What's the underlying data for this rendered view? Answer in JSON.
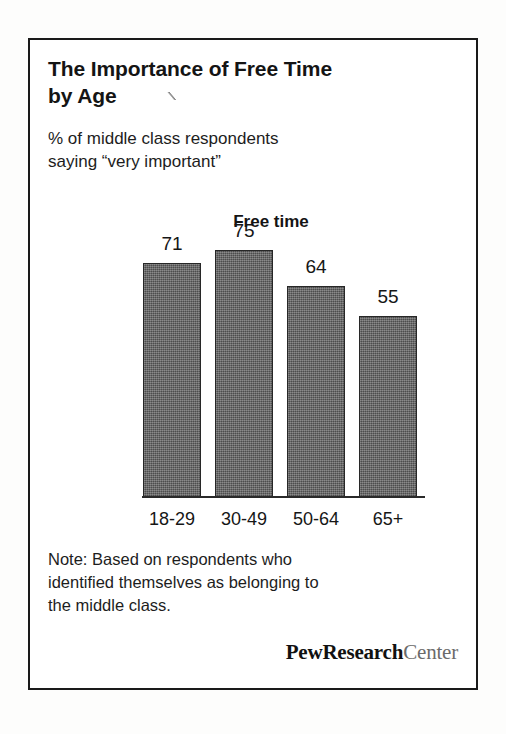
{
  "card": {
    "title": "The Importance of Free Time\nby Age",
    "subtitle": "% of middle class respondents\nsaying “very important”",
    "note": "Note: Based on respondents who\nidentified themselves as belonging to\nthe middle class.",
    "logo": {
      "primary": "PewResearch",
      "secondary": "Center"
    }
  },
  "colors": {
    "bar_fill": "#5e5e5e",
    "bar_outline": "#272727",
    "text": "#161616",
    "frame": "#1a1a1a",
    "logo_secondary": "#6b6b6b"
  },
  "chart_data": {
    "type": "bar",
    "title": "Free time",
    "categories": [
      "18-29",
      "30-49",
      "50-64",
      "65+"
    ],
    "values": [
      71,
      75,
      64,
      55
    ],
    "value_labels": [
      "71",
      "75",
      "64",
      "55"
    ],
    "xlabel": "",
    "ylabel": "",
    "ylim": [
      0,
      90
    ],
    "grid": false,
    "legend": "none",
    "series": [
      {
        "name": "Free time",
        "values": [
          71,
          75,
          64,
          55
        ]
      }
    ]
  }
}
